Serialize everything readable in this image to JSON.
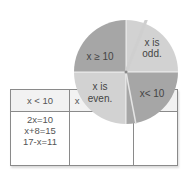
{
  "table": {
    "headers": [
      "x < 10",
      "x"
    ],
    "cells": [
      [
        "2x=10",
        "x+8=15",
        "17-x=11"
      ]
    ]
  },
  "spinner": {
    "sections": [
      {
        "label_line1": "x ≥ 10",
        "label_line2": "",
        "color": "#a9a9a9"
      },
      {
        "label_line1": "x is",
        "label_line2": "odd.",
        "color": "#d3d3d3"
      },
      {
        "label_line1": "x is",
        "label_line2": "even.",
        "color": "#d3d3d3"
      },
      {
        "label_line1": "x< 10",
        "label_line2": "",
        "color": "#a9a9a9"
      }
    ]
  }
}
